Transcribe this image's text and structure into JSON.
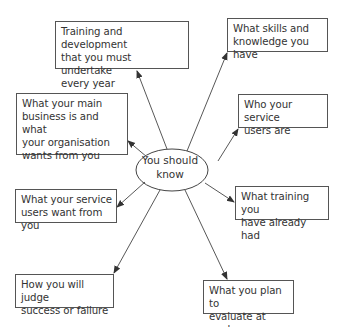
{
  "diagram": {
    "type": "mind-map",
    "center": {
      "label": "You should\nknow"
    },
    "nodes": [
      {
        "id": "training-development",
        "label": "Training and development\nthat you must undertake\nevery year"
      },
      {
        "id": "skills-knowledge",
        "label": "What skills and\nknowledge you have"
      },
      {
        "id": "main-business",
        "label": "What your main\nbusiness is and what\nyour organisation\nwants from you"
      },
      {
        "id": "service-users",
        "label": "Who your service\nusers are"
      },
      {
        "id": "service-users-want",
        "label": "What your service\nusers want from you"
      },
      {
        "id": "training-had",
        "label": "What training you\nhave already had"
      },
      {
        "id": "judge-success",
        "label": "How you will judge\nsuccess or failure"
      },
      {
        "id": "plan-evaluate",
        "label": "What you plan to\nevaluate at work"
      }
    ],
    "colors": {
      "line": "#444444",
      "box_border": "#555555",
      "text": "#333333",
      "background": "#ffffff"
    }
  }
}
